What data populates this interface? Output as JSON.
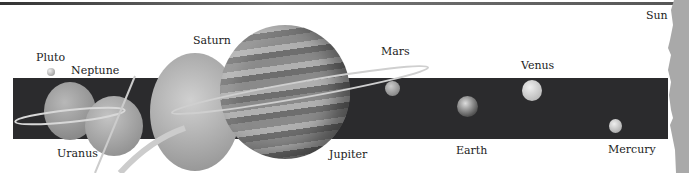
{
  "diagram": {
    "labels": {
      "sun": "Sun",
      "mercury": "Mercury",
      "venus": "Venus",
      "earth": "Earth",
      "mars": "Mars",
      "jupiter": "Jupiter",
      "saturn": "Saturn",
      "uranus": "Uranus",
      "neptune": "Neptune",
      "pluto": "Pluto"
    },
    "colors": {
      "band": "#2b2b2d",
      "sun": "#a9a9a9",
      "planet_gray": "#9a9a9a",
      "label": "#222222"
    }
  }
}
